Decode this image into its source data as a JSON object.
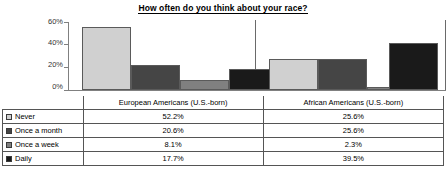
{
  "chart_data": {
    "type": "bar",
    "title": "How often do you think about your race?",
    "xlabel": "",
    "ylabel": "",
    "ylim": [
      0,
      60
    ],
    "ytick_labels": [
      "60%",
      "40%",
      "20%",
      "0%"
    ],
    "ytick_values": [
      60,
      40,
      20,
      0
    ],
    "grid": false,
    "legend_position": "table-below",
    "categories": [
      "European Americans (U.S.-born)",
      "African Americans (U.S.-born)"
    ],
    "series": [
      {
        "name": "Never",
        "color": "#d0d0d0",
        "values": [
          52.2,
          25.6
        ],
        "labels": [
          "52.2%",
          "25.6%"
        ]
      },
      {
        "name": "Once a month",
        "color": "#454545",
        "values": [
          20.6,
          25.6
        ],
        "labels": [
          "20.6%",
          "25.6%"
        ]
      },
      {
        "name": "Once a week",
        "color": "#808080",
        "values": [
          8.1,
          2.3
        ],
        "labels": [
          "8.1%",
          "2.3%"
        ]
      },
      {
        "name": "Daily",
        "color": "#1a1a1a",
        "values": [
          17.7,
          39.5
        ],
        "labels": [
          "17.7%",
          "39.5%"
        ]
      }
    ]
  },
  "chart": {
    "title": "How often do you think about your race?",
    "yticks": [
      {
        "label": "60%",
        "value": 60
      },
      {
        "label": "40%",
        "value": 40
      },
      {
        "label": "20%",
        "value": 20
      },
      {
        "label": "0%",
        "value": 0
      }
    ],
    "groups": [
      {
        "label": "European Americans (U.S.-born)"
      },
      {
        "label": "African Americans (U.S.-born)"
      }
    ]
  },
  "table": {
    "header": [
      "",
      "European Americans (U.S.-born)",
      "African Americans (U.S.-born)"
    ],
    "rows": [
      {
        "legend": "Never",
        "swatch": "#d0d0d0",
        "european": "52.2%",
        "african": "25.6%"
      },
      {
        "legend": "Once a month",
        "swatch": "#454545",
        "european": "20.6%",
        "african": "25.6%"
      },
      {
        "legend": "Once a week",
        "swatch": "#808080",
        "european": "8.1%",
        "african": "2.3%"
      },
      {
        "legend": "Daily",
        "swatch": "#1a1a1a",
        "european": "17.7%",
        "african": "39.5%"
      }
    ]
  }
}
